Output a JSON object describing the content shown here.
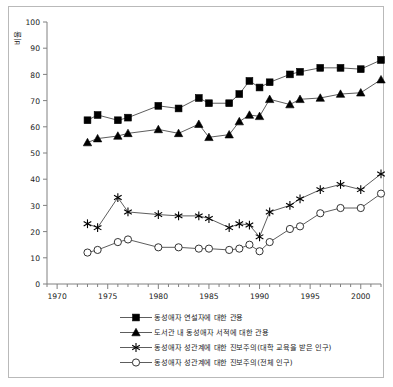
{
  "chart_data": {
    "type": "line",
    "title": "",
    "xlabel": "",
    "ylabel": "비율",
    "xlim": [
      1969,
      2002
    ],
    "ylim": [
      0,
      100
    ],
    "yticks": [
      0,
      10,
      20,
      30,
      40,
      50,
      60,
      70,
      80,
      90,
      100
    ],
    "xticks": [
      1970,
      1975,
      1980,
      1985,
      1990,
      1995,
      2000
    ],
    "grid": false,
    "legend_position": "bottom",
    "series": [
      {
        "name": "동성애자 연설자에 대한 관용",
        "marker": "square",
        "x": [
          1973,
          1974,
          1976,
          1977,
          1980,
          1982,
          1984,
          1985,
          1987,
          1988,
          1989,
          1990,
          1991,
          1993,
          1994,
          1996,
          1998,
          2000,
          2002
        ],
        "values": [
          62.5,
          64.5,
          62.5,
          63.5,
          68,
          67,
          71,
          69,
          69,
          72.5,
          77.5,
          75,
          77,
          80,
          81,
          82.5,
          82.5,
          82,
          85.5
        ]
      },
      {
        "name": "도서관 내 동성애자 서적에 대한 관용",
        "marker": "triangle",
        "x": [
          1973,
          1974,
          1976,
          1977,
          1980,
          1982,
          1984,
          1985,
          1987,
          1988,
          1989,
          1990,
          1991,
          1993,
          1994,
          1996,
          1998,
          2000,
          2002
        ],
        "values": [
          54,
          55.5,
          56.5,
          57.5,
          59,
          57.5,
          61,
          56,
          57,
          62,
          64.5,
          64,
          70.5,
          68.5,
          70.5,
          71,
          72.5,
          73,
          78
        ]
      },
      {
        "name": "동성애자 성관계에 대한 진보주의(대학 교육을 받은 인구)",
        "marker": "star",
        "x": [
          1973,
          1974,
          1976,
          1977,
          1980,
          1982,
          1984,
          1985,
          1987,
          1988,
          1989,
          1990,
          1991,
          1993,
          1994,
          1996,
          1998,
          2000,
          2002
        ],
        "values": [
          23,
          21.5,
          33,
          27.5,
          26.5,
          26,
          26,
          25,
          21.5,
          23,
          22.5,
          18,
          27.5,
          30,
          32.5,
          36,
          38,
          36,
          42
        ]
      },
      {
        "name": "동성애자 성관계에 대한 진보주의(전체 인구)",
        "marker": "circle",
        "x": [
          1973,
          1974,
          1976,
          1977,
          1980,
          1982,
          1984,
          1985,
          1987,
          1988,
          1989,
          1990,
          1991,
          1993,
          1994,
          1996,
          1998,
          2000,
          2002
        ],
        "values": [
          12,
          13,
          16,
          17,
          14,
          14,
          13.5,
          13.5,
          13,
          13.5,
          15,
          12.5,
          16,
          21,
          22,
          27,
          29,
          29,
          34.5
        ]
      }
    ]
  },
  "axis": {
    "ylabel": "비율",
    "ytick_labels": [
      "0",
      "10",
      "20",
      "30",
      "40",
      "50",
      "60",
      "70",
      "80",
      "90",
      "100"
    ],
    "xtick_labels": [
      "1970",
      "1975",
      "1980",
      "1985",
      "1990",
      "1995",
      "2000"
    ]
  },
  "legend": {
    "items": [
      {
        "label": "동성애자 연설자에 대한 관용",
        "marker": "square"
      },
      {
        "label": "도서관 내 동성애자 서적에 대한 관용",
        "marker": "triangle"
      },
      {
        "label": "동성애자 성관계에 대한 진보주의(대학 교육을 받은 인구)",
        "marker": "star"
      },
      {
        "label": "동성애자 성관계에 대한 진보주의(전체 인구)",
        "marker": "circle"
      }
    ]
  },
  "colors": {
    "line": "#333333",
    "marker_fill": "#000000",
    "open_marker_fill": "#ffffff",
    "axis": "#808080",
    "frame": "#b9b9b9",
    "text": "#1a1a1a"
  }
}
